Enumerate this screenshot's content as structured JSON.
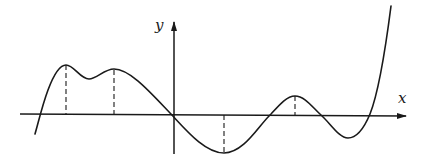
{
  "diagram": {
    "type": "function-graph",
    "axes": {
      "x_label": "x",
      "y_label": "y"
    },
    "colors": {
      "stroke": "#1a1a1a",
      "background": "#ffffff"
    },
    "curve": {
      "description": "Smooth function with local maxima and minima; critical points marked by dashed vertical lines to the x-axis",
      "critical_points": [
        {
          "kind": "local-max",
          "sign": "positive"
        },
        {
          "kind": "local-max",
          "sign": "positive"
        },
        {
          "kind": "local-min",
          "sign": "negative"
        },
        {
          "kind": "local-max",
          "sign": "positive"
        }
      ]
    }
  }
}
